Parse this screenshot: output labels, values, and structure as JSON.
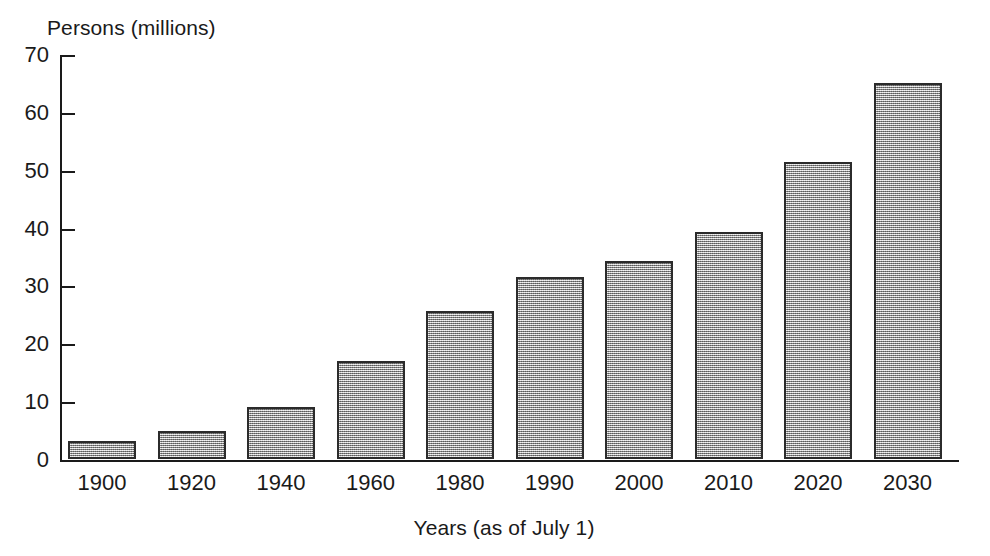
{
  "chart_data": {
    "type": "bar",
    "title": "",
    "xlabel": "Years (as of July 1)",
    "ylabel": "Persons (millions)",
    "categories": [
      "1900",
      "1920",
      "1940",
      "1960",
      "1980",
      "1990",
      "2000",
      "2010",
      "2020",
      "2030"
    ],
    "values": [
      3.1,
      4.9,
      9.0,
      16.9,
      25.5,
      31.4,
      34.2,
      39.2,
      51.4,
      65.0
    ],
    "ylim": [
      0,
      70
    ],
    "yticks": [
      0,
      10,
      20,
      30,
      40,
      50,
      60,
      70
    ],
    "ytick_labels": [
      "0",
      "10",
      "20",
      "30",
      "40",
      "50",
      "60",
      "70"
    ],
    "grid": false,
    "legend": false,
    "bar_fill_color": "#a8a8a8",
    "bar_edge_color": "#2b2b2b",
    "axis_color": "#1a1a1a"
  }
}
